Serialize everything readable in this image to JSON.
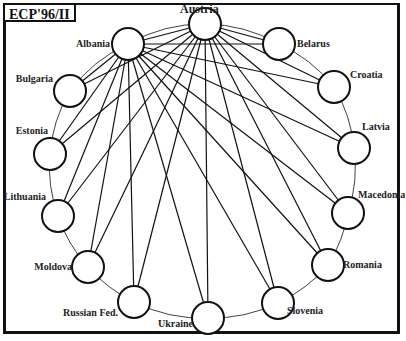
{
  "title": "ECP'96/II",
  "colors": {
    "stroke": "#111111",
    "background": "#ffffff",
    "text": "#222222"
  },
  "ring": {
    "cx": 205,
    "cy": 170,
    "rx": 150,
    "ry": 147
  },
  "node_radius": 16,
  "hubs": [
    "Austria",
    "Albania"
  ],
  "nodes": [
    {
      "id": "austria",
      "label": "Austria",
      "x": 205,
      "y": 24,
      "lx": 180,
      "ly": 13,
      "anchor": "start",
      "big": true
    },
    {
      "id": "belarus",
      "label": "Belarus",
      "x": 279,
      "y": 44,
      "lx": 297,
      "ly": 47,
      "anchor": "start"
    },
    {
      "id": "croatia",
      "label": "Croatia",
      "x": 334,
      "y": 87,
      "lx": 350,
      "ly": 78,
      "anchor": "start"
    },
    {
      "id": "latvia",
      "label": "Latvia",
      "x": 354,
      "y": 148,
      "lx": 362,
      "ly": 130,
      "anchor": "start"
    },
    {
      "id": "macedonia",
      "label": "Macedonia",
      "x": 348,
      "y": 213,
      "lx": 358,
      "ly": 198,
      "anchor": "start"
    },
    {
      "id": "romania",
      "label": "Romania",
      "x": 328,
      "y": 265,
      "lx": 343,
      "ly": 268,
      "anchor": "start"
    },
    {
      "id": "slovenia",
      "label": "Slovenia",
      "x": 278,
      "y": 303,
      "lx": 287,
      "ly": 314,
      "anchor": "start"
    },
    {
      "id": "ukraine",
      "label": "Ukraine",
      "x": 208,
      "y": 318,
      "lx": 193,
      "ly": 327,
      "anchor": "end"
    },
    {
      "id": "russian-fed",
      "label": "Russian Fed.",
      "x": 134,
      "y": 302,
      "lx": 118,
      "ly": 316,
      "anchor": "end"
    },
    {
      "id": "moldova",
      "label": "Moldova",
      "x": 88,
      "y": 267,
      "lx": 72,
      "ly": 270,
      "anchor": "end"
    },
    {
      "id": "lithuania",
      "label": "Lithuania",
      "x": 58,
      "y": 216,
      "lx": 46,
      "ly": 200,
      "anchor": "end"
    },
    {
      "id": "estonia",
      "label": "Estonia",
      "x": 50,
      "y": 154,
      "lx": 48,
      "ly": 134,
      "anchor": "end"
    },
    {
      "id": "bulgaria",
      "label": "Bulgaria",
      "x": 70,
      "y": 91,
      "lx": 53,
      "ly": 82,
      "anchor": "end"
    },
    {
      "id": "albania",
      "label": "Albania",
      "x": 128,
      "y": 44,
      "lx": 110,
      "ly": 47,
      "anchor": "end"
    }
  ],
  "edges_description": "Austria and Albania each connect by a straight line to every other node; adjacent nodes are joined by a thin arc along the outer ring."
}
